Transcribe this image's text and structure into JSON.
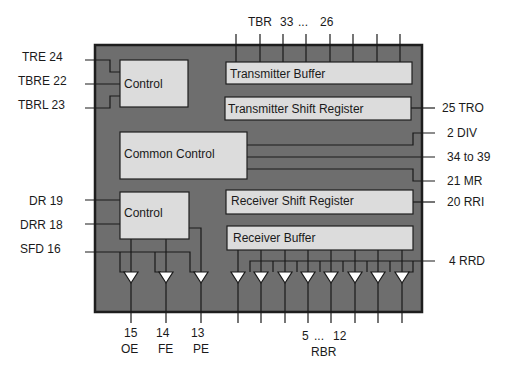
{
  "diagram": {
    "colors": {
      "chip_fill": "#6e6e6e",
      "chip_border": "#1e1e1e",
      "block_fill": "#dcdcdc",
      "line": "#1a1a1a",
      "buffer_fill": "#ffffff"
    },
    "blocks": {
      "control_tx": "Control",
      "tx_buffer": "Transmitter Buffer",
      "tx_shift": "Transmitter Shift Register",
      "common_control": "Common Control",
      "control_rx": "Control",
      "rx_shift": "Receiver Shift Register",
      "rx_buffer": "Receiver Buffer"
    },
    "left_pins": {
      "tre": "TRE 24",
      "tbre": "TBRE 22",
      "tbrl": "TBRL 23",
      "dr": "DR 19",
      "drr": "DRR 18",
      "sfd": "SFD 16"
    },
    "right_pins": {
      "tro": "25 TRO",
      "div": "2 DIV",
      "range": "34 to 39",
      "mr": "21 MR",
      "rri": "20 RRI",
      "rrd": "4 RRD"
    },
    "top_pins": {
      "tbr": "TBR",
      "from": "33",
      "dots": "...",
      "to": "26"
    },
    "bottom_pins": {
      "oe_num": "15",
      "oe": "OE",
      "fe_num": "14",
      "fe": "FE",
      "pe_num": "13",
      "pe": "PE",
      "rbr_from": "5",
      "rbr_dots": "...",
      "rbr_to": "12",
      "rbr": "RBR"
    }
  }
}
